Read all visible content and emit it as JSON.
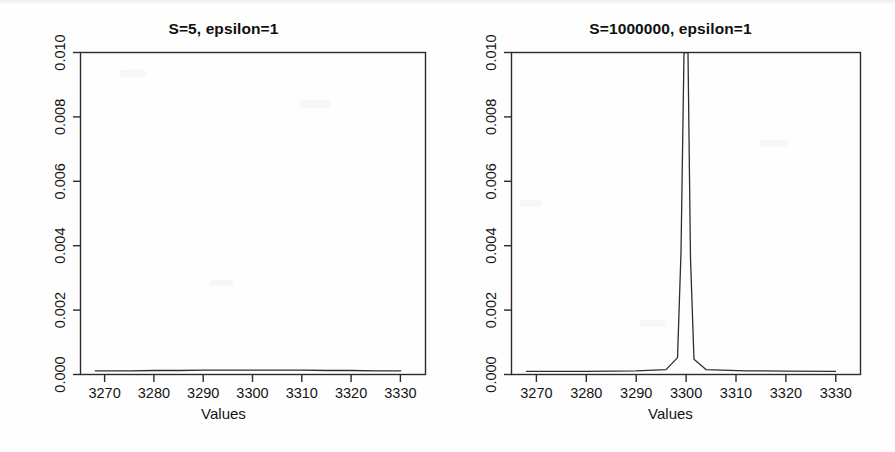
{
  "figure": {
    "background_color": "#fefefe",
    "foreground_color": "#2b2b2b",
    "panel_count": 2
  },
  "chart_data": [
    {
      "type": "line",
      "title": "S=5, epsilon=1",
      "xlabel": "Values",
      "ylabel": "Probability",
      "xlim": [
        3265,
        3335
      ],
      "ylim": [
        0.0,
        0.0105
      ],
      "xticks": [
        3270,
        3280,
        3290,
        3300,
        3310,
        3320,
        3330
      ],
      "xtick_labels": [
        "3270",
        "3280",
        "3290",
        "3300",
        "3310",
        "3320",
        "3330"
      ],
      "yticks": [
        0.0,
        0.002,
        0.004,
        0.006,
        0.008,
        0.01
      ],
      "ytick_labels": [
        "0.000",
        "0.002",
        "0.004",
        "0.006",
        "0.008",
        "0.010"
      ],
      "grid": false,
      "legend": null,
      "series": [
        {
          "name": "probability",
          "x": [
            3268,
            3275,
            3280,
            3285,
            3290,
            3295,
            3300,
            3305,
            3310,
            3315,
            3320,
            3325,
            3330
          ],
          "y": [
            0.00012,
            0.00012,
            0.00013,
            0.00013,
            0.00014,
            0.00014,
            0.00014,
            0.00014,
            0.00014,
            0.00013,
            0.00013,
            0.00012,
            0.00012
          ]
        }
      ],
      "annotation": "Essentially flat near-zero probability across the full range; no visible peak at this scale."
    },
    {
      "type": "line",
      "title": "S=1000000, epsilon=1",
      "xlabel": "Values",
      "ylabel": "Probability",
      "xlim": [
        3265,
        3335
      ],
      "ylim": [
        0.0,
        0.0105
      ],
      "xticks": [
        3270,
        3280,
        3290,
        3300,
        3310,
        3320,
        3330
      ],
      "xtick_labels": [
        "3270",
        "3280",
        "3290",
        "3300",
        "3310",
        "3320",
        "3330"
      ],
      "yticks": [
        0.0,
        0.002,
        0.004,
        0.006,
        0.008,
        0.01
      ],
      "ytick_labels": [
        "0.000",
        "0.002",
        "0.004",
        "0.006",
        "0.008",
        "0.010"
      ],
      "grid": false,
      "legend": null,
      "series": [
        {
          "name": "probability",
          "x": [
            3268,
            3280,
            3290,
            3296,
            3298.3,
            3299.0,
            3299.6,
            3300.0,
            3300.4,
            3300.9,
            3301.6,
            3304,
            3312,
            3320,
            3330
          ],
          "y": [
            0.0001,
            0.0001,
            0.00012,
            0.00016,
            0.00055,
            0.004,
            0.0105,
            0.0105,
            0.0105,
            0.0038,
            0.0005,
            0.00016,
            0.00012,
            0.00011,
            0.0001
          ]
        }
      ],
      "annotation": "Extremely narrow spike centred at 3300 that is clipped by the top of the plot region; flat near-zero elsewhere."
    }
  ],
  "panels": [
    {
      "id": "left",
      "title": "S=5, epsilon=1",
      "xlabel": "Values",
      "ylabel": "Probability"
    },
    {
      "id": "right",
      "title": "S=1000000, epsilon=1",
      "xlabel": "Values",
      "ylabel": "Probability"
    }
  ]
}
